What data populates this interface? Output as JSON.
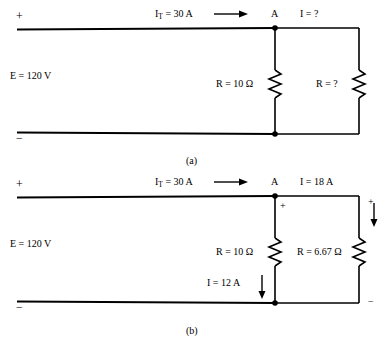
{
  "figure": {
    "panels": [
      {
        "id": "a",
        "caption": "(a)",
        "source": {
          "plus_sign": "+",
          "minus_sign": "−",
          "voltage_label": "E = 120 V"
        },
        "total_current": {
          "symbol": "I",
          "subscript": "T",
          "equals_value": " = 30 A",
          "full_text": "I_T = 30 A",
          "arrow": "right-arrow"
        },
        "node_label": "A",
        "branch_current_label": "I = ?",
        "resistors": [
          {
            "name": "middle-resistor",
            "label": "R = 10 Ω"
          },
          {
            "name": "right-resistor",
            "label": "R = ?"
          }
        ]
      },
      {
        "id": "b",
        "caption": "(b)",
        "source": {
          "plus_sign": "+",
          "minus_sign": "−",
          "voltage_label": "E = 120 V"
        },
        "total_current": {
          "symbol": "I",
          "subscript": "T",
          "equals_value": " = 30 A",
          "full_text": "I_T = 30 A",
          "arrow": "right-arrow"
        },
        "node_label": "A",
        "branch_current_label": "I = 18 A",
        "middle_branch_plus": "+",
        "middle_branch_current": "I = 12 A",
        "middle_branch_arrow": "down-arrow",
        "right_branch_plus": "+",
        "right_branch_minus": "−",
        "right_branch_arrow": "down-arrow",
        "resistors": [
          {
            "name": "middle-resistor",
            "label": "R = 10 Ω"
          },
          {
            "name": "right-resistor",
            "label": "R = 6.67 Ω"
          }
        ]
      }
    ],
    "colors": {
      "wire": "#000000",
      "background": "#ffffff"
    }
  }
}
